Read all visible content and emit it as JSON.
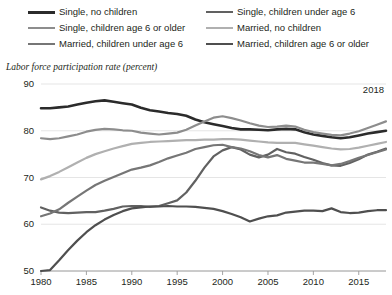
{
  "subtitle": "Labor force participation rate (percent)",
  "annotation": "2018",
  "legend": {
    "left_column": [
      {
        "label": "Single, no children",
        "color": "#2b2b2b",
        "width": 2.6
      },
      {
        "label": "Single, children age 6 or older",
        "color": "#8d8d8d",
        "width": 2.2
      },
      {
        "label": "Married, children under age 6",
        "color": "#767676",
        "width": 2.2
      }
    ],
    "right_column": [
      {
        "label": "Single, children under age 6",
        "color": "#616161",
        "width": 2.2
      },
      {
        "label": "Married, no children",
        "color": "#b0b0b0",
        "width": 2.2
      },
      {
        "label": "Married, children age 6 or older",
        "color": "#4f4f4f",
        "width": 2.2
      }
    ]
  },
  "chart_data": {
    "type": "line",
    "title": "",
    "subtitle": "Labor force participation rate (percent)",
    "xlabel": "",
    "ylabel": "Labor force participation rate (percent)",
    "xlim": [
      1980,
      2018
    ],
    "ylim": [
      50,
      90
    ],
    "yticks": [
      50,
      60,
      70,
      80,
      90
    ],
    "xticks": [
      1980,
      1985,
      1990,
      1995,
      2000,
      2005,
      2010,
      2015
    ],
    "grid": "horizontal",
    "legend_position": "above-plot",
    "annotations": [
      {
        "text": "2018",
        "x": 2018,
        "y": 88
      }
    ],
    "x": [
      1980,
      1981,
      1982,
      1983,
      1984,
      1985,
      1986,
      1987,
      1988,
      1989,
      1990,
      1991,
      1992,
      1993,
      1994,
      1995,
      1996,
      1997,
      1998,
      1999,
      2000,
      2001,
      2002,
      2003,
      2004,
      2005,
      2006,
      2007,
      2008,
      2009,
      2010,
      2011,
      2012,
      2013,
      2014,
      2015,
      2016,
      2017,
      2018
    ],
    "series": [
      {
        "name": "Single, no children",
        "color": "#2b2b2b",
        "width": 2.6,
        "values": [
          84.8,
          84.8,
          85.0,
          85.2,
          85.6,
          86.0,
          86.3,
          86.5,
          86.2,
          85.9,
          85.6,
          84.9,
          84.4,
          84.1,
          83.8,
          83.6,
          83.2,
          82.4,
          81.8,
          81.4,
          81.0,
          80.6,
          80.3,
          80.3,
          80.2,
          80.1,
          80.3,
          80.4,
          80.3,
          79.7,
          79.2,
          78.9,
          78.6,
          78.4,
          78.6,
          79.0,
          79.4,
          79.7,
          80.0
        ]
      },
      {
        "name": "Single, children under age 6",
        "color": "#616161",
        "width": 2.2,
        "values": [
          63.6,
          62.9,
          62.5,
          62.4,
          62.5,
          62.6,
          62.6,
          62.9,
          63.3,
          63.8,
          63.9,
          63.9,
          63.7,
          63.9,
          64.5,
          65.1,
          66.8,
          69.3,
          72.1,
          74.5,
          75.8,
          76.5,
          76.0,
          74.9,
          74.3,
          74.9,
          76.1,
          75.4,
          75.1,
          74.4,
          73.8,
          73.1,
          72.6,
          72.5,
          73.1,
          73.9,
          74.9,
          75.5,
          76.2
        ]
      },
      {
        "name": "Single, children age 6 or older",
        "color": "#8d8d8d",
        "width": 2.2,
        "values": [
          78.4,
          78.2,
          78.4,
          78.8,
          79.2,
          79.8,
          80.2,
          80.4,
          80.3,
          80.1,
          80.0,
          79.6,
          79.4,
          79.2,
          79.4,
          79.6,
          80.2,
          81.1,
          82.0,
          82.8,
          83.1,
          82.7,
          82.2,
          81.6,
          81.1,
          80.8,
          80.9,
          81.1,
          80.9,
          80.2,
          79.7,
          79.4,
          79.1,
          79.0,
          79.4,
          79.9,
          80.6,
          81.3,
          82.0
        ]
      },
      {
        "name": "Married, no children",
        "color": "#b0b0b0",
        "width": 2.2,
        "values": [
          69.6,
          70.3,
          71.2,
          72.2,
          73.2,
          74.2,
          75.0,
          75.6,
          76.2,
          76.7,
          77.2,
          77.4,
          77.6,
          77.7,
          77.8,
          77.9,
          78.0,
          78.0,
          78.1,
          78.1,
          78.2,
          78.2,
          78.1,
          77.9,
          77.7,
          77.5,
          77.4,
          77.4,
          77.4,
          77.1,
          76.8,
          76.5,
          76.2,
          76.0,
          76.1,
          76.4,
          76.8,
          77.2,
          77.6
        ]
      },
      {
        "name": "Married, children under age 6",
        "color": "#767676",
        "width": 2.2,
        "values": [
          61.7,
          62.3,
          63.2,
          64.6,
          65.9,
          67.2,
          68.4,
          69.3,
          70.1,
          70.9,
          71.7,
          72.1,
          72.6,
          73.3,
          74.1,
          74.7,
          75.3,
          76.1,
          76.5,
          76.9,
          77.0,
          76.5,
          76.2,
          75.6,
          74.8,
          74.3,
          74.8,
          74.0,
          73.6,
          73.2,
          73.2,
          72.9,
          72.6,
          72.9,
          73.5,
          74.2,
          74.8,
          75.4,
          76.0
        ]
      },
      {
        "name": "Married, children age 6 or older",
        "color": "#4f4f4f",
        "width": 2.2,
        "values": [
          50.0,
          50.2,
          52.3,
          54.5,
          56.5,
          58.3,
          59.8,
          61.0,
          62.0,
          62.8,
          63.4,
          63.6,
          63.8,
          63.8,
          63.9,
          63.8,
          63.8,
          63.7,
          63.5,
          63.3,
          62.8,
          62.2,
          61.5,
          60.6,
          61.2,
          61.7,
          61.9,
          62.5,
          62.7,
          62.9,
          62.9,
          62.8,
          63.4,
          62.6,
          62.4,
          62.5,
          62.8,
          63.0,
          63.0
        ]
      }
    ]
  }
}
